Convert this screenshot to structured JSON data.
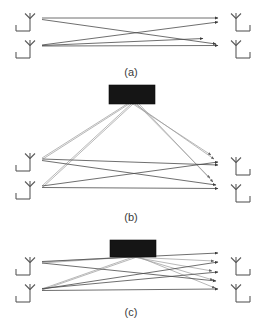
{
  "figure": {
    "background_color": "#ffffff",
    "line_color": "#6e6e6e",
    "surface_color": "#151515",
    "antenna_color": "#5a5a5a",
    "width": 265,
    "height": 331
  },
  "panels": [
    {
      "id": "a",
      "caption": "(a)",
      "caption_x": 131,
      "caption_y": 72,
      "description": "Direct MIMO link: two transmit antennas on the left and two receive antennas on the right connected by four direct propagation paths forming an X pattern",
      "has_surface": false,
      "tx_antennas": [
        {
          "name": "tx-antenna-1",
          "x": 30,
          "y": 18
        },
        {
          "name": "tx-antenna-2",
          "x": 30,
          "y": 45
        }
      ],
      "rx_antennas": [
        {
          "name": "rx-antenna-1",
          "x": 236,
          "y": 18
        },
        {
          "name": "rx-antenna-2",
          "x": 236,
          "y": 45
        }
      ],
      "direct_rays": [
        {
          "x1": 42,
          "y1": 18,
          "x2": 222,
          "y2": 18
        },
        {
          "x1": 42,
          "y1": 19,
          "x2": 220,
          "y2": 45
        },
        {
          "x1": 42,
          "y1": 45,
          "x2": 222,
          "y2": 22
        },
        {
          "x1": 42,
          "y1": 46,
          "x2": 222,
          "y2": 45
        },
        {
          "x1": 42,
          "y1": 46,
          "x2": 207,
          "y2": 39
        }
      ],
      "surface_rays": []
    },
    {
      "id": "b",
      "caption": "(b)",
      "caption_x": 131,
      "caption_y": 217,
      "description": "MIMO link assisted by a distant reconfigurable intelligent surface placed far above the antennas; reflected paths are long and shallow",
      "has_surface": true,
      "surface": {
        "name": "intelligent-surface-panel-b",
        "x": 109,
        "y": 85,
        "width": 46,
        "height": 19
      },
      "tx_antennas": [
        {
          "name": "tx-antenna-1",
          "x": 30,
          "y": 158
        },
        {
          "name": "tx-antenna-2",
          "x": 30,
          "y": 186
        }
      ],
      "rx_antennas": [
        {
          "name": "rx-antenna-1",
          "x": 236,
          "y": 162
        },
        {
          "name": "rx-antenna-2",
          "x": 236,
          "y": 189
        }
      ],
      "direct_rays": [
        {
          "x1": 42,
          "y1": 159,
          "x2": 222,
          "y2": 166
        },
        {
          "x1": 42,
          "y1": 160,
          "x2": 220,
          "y2": 186
        },
        {
          "x1": 42,
          "y1": 186,
          "x2": 222,
          "y2": 163
        },
        {
          "x1": 42,
          "y1": 187,
          "x2": 222,
          "y2": 189
        }
      ],
      "surface_rays": [
        {
          "x1": 42,
          "y1": 158,
          "x2": 128,
          "y2": 104
        },
        {
          "x1": 42,
          "y1": 186,
          "x2": 131,
          "y2": 104
        },
        {
          "x1": 131,
          "y1": 104,
          "x2": 215,
          "y2": 158
        },
        {
          "x1": 133,
          "y1": 104,
          "x2": 218,
          "y2": 163
        },
        {
          "x1": 134,
          "y1": 104,
          "x2": 213,
          "y2": 182
        },
        {
          "x1": 136,
          "y1": 104,
          "x2": 217,
          "y2": 186
        }
      ]
    },
    {
      "id": "c",
      "caption": "(c)",
      "caption_x": 131,
      "caption_y": 312,
      "description": "MIMO link assisted by a nearby reconfigurable intelligent surface located close to the antenna array; reflected paths are short and steep",
      "has_surface": true,
      "surface": {
        "name": "intelligent-surface-panel-c",
        "x": 110,
        "y": 240,
        "width": 46,
        "height": 17
      },
      "tx_antennas": [
        {
          "name": "tx-antenna-1",
          "x": 30,
          "y": 262
        },
        {
          "name": "tx-antenna-2",
          "x": 30,
          "y": 289
        }
      ],
      "rx_antennas": [
        {
          "name": "rx-antenna-1",
          "x": 236,
          "y": 262
        },
        {
          "name": "rx-antenna-2",
          "x": 236,
          "y": 289
        }
      ],
      "direct_rays": [
        {
          "x1": 42,
          "y1": 261,
          "x2": 222,
          "y2": 253
        },
        {
          "x1": 42,
          "y1": 262,
          "x2": 220,
          "y2": 281
        },
        {
          "x1": 42,
          "y1": 289,
          "x2": 222,
          "y2": 262
        },
        {
          "x1": 42,
          "y1": 290,
          "x2": 222,
          "y2": 289
        },
        {
          "x1": 42,
          "y1": 288,
          "x2": 222,
          "y2": 272
        }
      ],
      "surface_rays": [
        {
          "x1": 42,
          "y1": 262,
          "x2": 128,
          "y2": 257
        },
        {
          "x1": 42,
          "y1": 289,
          "x2": 133,
          "y2": 257
        },
        {
          "x1": 130,
          "y1": 257,
          "x2": 218,
          "y2": 262
        },
        {
          "x1": 134,
          "y1": 257,
          "x2": 216,
          "y2": 281
        },
        {
          "x1": 136,
          "y1": 257,
          "x2": 219,
          "y2": 289
        }
      ]
    }
  ]
}
